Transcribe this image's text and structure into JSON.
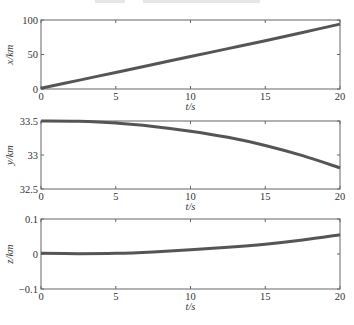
{
  "colors": {
    "line": "#555555",
    "axis": "#666666",
    "text": "#333333"
  },
  "chart_data": [
    {
      "type": "line",
      "title": "",
      "xlabel": "t/s",
      "ylabel": "x/km",
      "xlim": [
        0,
        20
      ],
      "ylim": [
        0,
        100
      ],
      "xticks": [
        0,
        5,
        10,
        15,
        20
      ],
      "yticks": [
        0,
        50,
        100
      ],
      "ytick_labels": [
        "0",
        "50",
        "100"
      ],
      "grid": false,
      "x": [
        0,
        2.5,
        5,
        7.5,
        10,
        12.5,
        15,
        17.5,
        20
      ],
      "series": [
        {
          "name": "x",
          "values": [
            1,
            12.5,
            24,
            35.5,
            47,
            58.5,
            70,
            82,
            94
          ]
        }
      ]
    },
    {
      "type": "line",
      "title": "",
      "xlabel": "t/s",
      "ylabel": "y/km",
      "xlim": [
        0,
        20
      ],
      "ylim": [
        32.5,
        33.5
      ],
      "xticks": [
        0,
        5,
        10,
        15,
        20
      ],
      "yticks": [
        32.5,
        33,
        33.5
      ],
      "ytick_labels": [
        "32.5",
        "33",
        "33.5"
      ],
      "grid": false,
      "x": [
        0,
        2.5,
        5,
        7.5,
        10,
        12.5,
        15,
        17.5,
        20
      ],
      "series": [
        {
          "name": "y",
          "values": [
            33.5,
            33.495,
            33.47,
            33.42,
            33.35,
            33.26,
            33.14,
            32.99,
            32.81
          ]
        }
      ]
    },
    {
      "type": "line",
      "title": "",
      "xlabel": "t/s",
      "ylabel": "z/km",
      "xlim": [
        0,
        20
      ],
      "ylim": [
        -0.1,
        0.1
      ],
      "xticks": [
        0,
        5,
        10,
        15,
        20
      ],
      "yticks": [
        -0.1,
        0,
        0.1
      ],
      "ytick_labels": [
        "−0.1",
        "0",
        "0.1"
      ],
      "grid": false,
      "x": [
        0,
        2.5,
        5,
        7.5,
        10,
        12.5,
        15,
        17.5,
        20
      ],
      "series": [
        {
          "name": "z",
          "values": [
            0.002,
            0.001,
            0.002,
            0.006,
            0.012,
            0.019,
            0.028,
            0.04,
            0.055
          ]
        }
      ]
    }
  ],
  "panels": [
    {
      "ylabel": "x/km",
      "xlabel": "t/s",
      "xtick_labels": [
        "0",
        "5",
        "10",
        "15",
        "20"
      ],
      "ytick_labels": [
        "0",
        "50",
        "100"
      ]
    },
    {
      "ylabel": "y/km",
      "xlabel": "t/s",
      "xtick_labels": [
        "0",
        "5",
        "10",
        "15",
        "20"
      ],
      "ytick_labels": [
        "32.5",
        "33",
        "33.5"
      ]
    },
    {
      "ylabel": "z/km",
      "xlabel": "t/s",
      "xtick_labels": [
        "0",
        "5",
        "10",
        "15",
        "20"
      ],
      "ytick_labels": [
        "−0.1",
        "0",
        "0.1"
      ]
    }
  ]
}
